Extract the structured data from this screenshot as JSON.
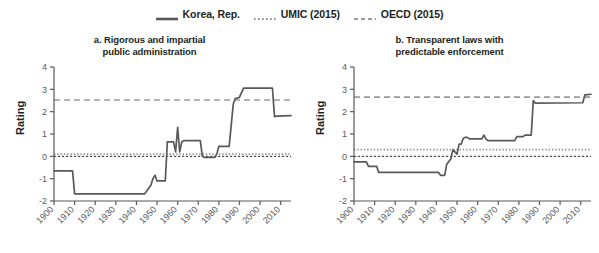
{
  "legend": {
    "items": [
      {
        "label": "Korea, Rep.",
        "style": "solid",
        "color": "#58595b"
      },
      {
        "label": "UMIC (2015)",
        "style": "dotted",
        "color": "#8c8c8c"
      },
      {
        "label": "OECD (2015)",
        "style": "dashed",
        "color": "#9b9b9b"
      }
    ]
  },
  "colors": {
    "series": "#58595b",
    "umic": "#8c8c8c",
    "oecd": "#9b9b9b",
    "zero": "#231f20",
    "axis": "#58595b",
    "text": "#231f20"
  },
  "ylabel": "Rating",
  "chart_data": [
    {
      "type": "line",
      "panel": "a",
      "title": "a. Rigorous and impartial public administration",
      "title_lines": [
        "a. Rigorous and impartial",
        "public administration"
      ],
      "xlabel": "",
      "ylabel": "Rating",
      "xlim": [
        1900,
        2015
      ],
      "ylim": [
        -2,
        4
      ],
      "yticks": [
        -2,
        -1,
        0,
        1,
        2,
        3,
        4
      ],
      "xticks": [
        1900,
        1910,
        1920,
        1930,
        1940,
        1950,
        1960,
        1970,
        1980,
        1990,
        2000,
        2010
      ],
      "grid": false,
      "legend_position": "top-center",
      "reference_lines": [
        {
          "name": "OECD (2015)",
          "value": 2.52,
          "style": "dashed",
          "color": "#9b9b9b"
        },
        {
          "name": "UMIC (2015)",
          "value": 0.1,
          "style": "dotted",
          "color": "#8c8c8c"
        },
        {
          "name": "zero",
          "value": 0,
          "style": "dashed-thin",
          "color": "#231f20"
        }
      ],
      "series": [
        {
          "name": "Korea, Rep.",
          "color": "#58595b",
          "x": [
            1900,
            1909,
            1910,
            1944,
            1945,
            1947,
            1948,
            1949,
            1950,
            1951,
            1952,
            1953,
            1954,
            1955,
            1958,
            1959,
            1960,
            1961,
            1962,
            1963,
            1964,
            1971,
            1972,
            1973,
            1978,
            1979,
            1980,
            1985,
            1986,
            1987,
            1988,
            1989,
            1990,
            1992,
            1993,
            2006,
            2007,
            2008,
            2015
          ],
          "y": [
            -0.65,
            -0.65,
            -1.68,
            -1.68,
            -1.55,
            -1.3,
            -1.0,
            -0.85,
            -1.1,
            -1.1,
            -1.1,
            -1.1,
            -1.1,
            0.65,
            0.65,
            0.2,
            1.3,
            0.2,
            0.65,
            0.7,
            0.7,
            0.7,
            0.0,
            -0.05,
            -0.05,
            0.1,
            0.45,
            0.45,
            1.4,
            2.35,
            2.6,
            2.6,
            2.65,
            3.05,
            3.05,
            3.05,
            1.78,
            1.8,
            1.82
          ]
        }
      ]
    },
    {
      "type": "line",
      "panel": "b",
      "title": "b. Transparent laws with predictable enforcement",
      "title_lines": [
        "b. Transparent laws with",
        "predictable enforcement"
      ],
      "xlabel": "",
      "ylabel": "Rating",
      "xlim": [
        1900,
        2015
      ],
      "ylim": [
        -2,
        4
      ],
      "yticks": [
        -2,
        -1,
        0,
        1,
        2,
        3,
        4
      ],
      "xticks": [
        1900,
        1910,
        1920,
        1930,
        1940,
        1950,
        1960,
        1970,
        1980,
        1990,
        2000,
        2010
      ],
      "grid": false,
      "legend_position": "top-center",
      "reference_lines": [
        {
          "name": "OECD (2015)",
          "value": 2.65,
          "style": "dashed",
          "color": "#9b9b9b"
        },
        {
          "name": "UMIC (2015)",
          "value": 0.3,
          "style": "dotted",
          "color": "#8c8c8c"
        },
        {
          "name": "zero",
          "value": 0,
          "style": "dashed-thin",
          "color": "#231f20"
        }
      ],
      "series": [
        {
          "name": "Korea, Rep.",
          "color": "#58595b",
          "x": [
            1900,
            1906,
            1907,
            1911,
            1912,
            1941,
            1942,
            1944,
            1945,
            1947,
            1948,
            1950,
            1951,
            1952,
            1953,
            1954,
            1955,
            1956,
            1962,
            1963,
            1964,
            1965,
            1978,
            1979,
            1982,
            1983,
            1986,
            1987,
            1988,
            2011,
            2012,
            2015
          ],
          "y": [
            -0.25,
            -0.25,
            -0.45,
            -0.45,
            -0.72,
            -0.72,
            -0.85,
            -0.85,
            -0.35,
            -0.12,
            0.3,
            0.1,
            0.55,
            0.55,
            0.8,
            0.85,
            0.85,
            0.78,
            0.78,
            0.95,
            0.78,
            0.7,
            0.7,
            0.88,
            0.88,
            0.95,
            0.95,
            2.5,
            2.38,
            2.4,
            2.75,
            2.78
          ]
        }
      ]
    }
  ]
}
